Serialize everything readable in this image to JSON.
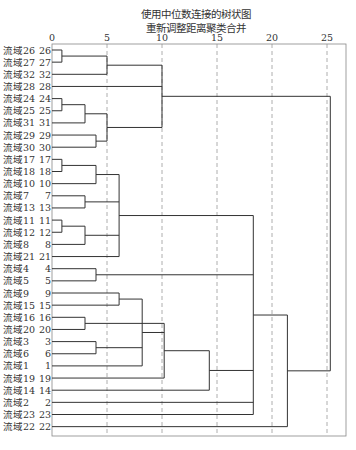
{
  "chart_data": {
    "type": "dendrogram",
    "title": "使用中位数连接的树状图",
    "subtitle": "重新调整距离聚类合并",
    "xlabel": "",
    "ylabel": "",
    "xlim": [
      0,
      25
    ],
    "x_ticks": [
      0,
      5,
      10,
      15,
      20,
      25
    ],
    "grid": "dashed vertical at ticks",
    "leaves": [
      {
        "label": "流域26",
        "id": "26"
      },
      {
        "label": "流域27",
        "id": "27"
      },
      {
        "label": "流域32",
        "id": "32"
      },
      {
        "label": "流域28",
        "id": "28"
      },
      {
        "label": "流域24",
        "id": "24"
      },
      {
        "label": "流域25",
        "id": "25"
      },
      {
        "label": "流域31",
        "id": "31"
      },
      {
        "label": "流域29",
        "id": "29"
      },
      {
        "label": "流域30",
        "id": "30"
      },
      {
        "label": "流域17",
        "id": "17"
      },
      {
        "label": "流域18",
        "id": "18"
      },
      {
        "label": "流域10",
        "id": "10"
      },
      {
        "label": "流域7",
        "id": "7"
      },
      {
        "label": "流域13",
        "id": "13"
      },
      {
        "label": "流域11",
        "id": "11"
      },
      {
        "label": "流域12",
        "id": "12"
      },
      {
        "label": "流域8",
        "id": "8"
      },
      {
        "label": "流域21",
        "id": "21"
      },
      {
        "label": "流域4",
        "id": "4"
      },
      {
        "label": "流域5",
        "id": "5"
      },
      {
        "label": "流域9",
        "id": "9"
      },
      {
        "label": "流域15",
        "id": "15"
      },
      {
        "label": "流域16",
        "id": "16"
      },
      {
        "label": "流域20",
        "id": "20"
      },
      {
        "label": "流域3",
        "id": "3"
      },
      {
        "label": "流域6",
        "id": "6"
      },
      {
        "label": "流域1",
        "id": "1"
      },
      {
        "label": "流域19",
        "id": "19"
      },
      {
        "label": "流域14",
        "id": "14"
      },
      {
        "label": "流域2",
        "id": "2"
      },
      {
        "label": "流域23",
        "id": "23"
      },
      {
        "label": "流域22",
        "id": "22"
      }
    ],
    "merges": [
      {
        "id": "m1",
        "children": [
          0,
          1
        ],
        "height": 0.9
      },
      {
        "id": "m2",
        "children": [
          "m1",
          2
        ],
        "height": 5.0
      },
      {
        "id": "m3",
        "children": [
          4,
          5
        ],
        "height": 0.9
      },
      {
        "id": "m4",
        "children": [
          "m3",
          6
        ],
        "height": 3.0
      },
      {
        "id": "m5",
        "children": [
          7,
          8
        ],
        "height": 4.0
      },
      {
        "id": "m6",
        "children": [
          "m4",
          "m5"
        ],
        "height": 5.0
      },
      {
        "id": "m7",
        "children": [
          "m2",
          3,
          "m6"
        ],
        "height": 10.0
      },
      {
        "id": "m8",
        "children": [
          9,
          10
        ],
        "height": 0.9
      },
      {
        "id": "m9",
        "children": [
          "m8",
          11
        ],
        "height": 4.0
      },
      {
        "id": "m10",
        "children": [
          12,
          13
        ],
        "height": 3.0
      },
      {
        "id": "m11",
        "children": [
          14,
          15
        ],
        "height": 0.9
      },
      {
        "id": "m12",
        "children": [
          "m11",
          16
        ],
        "height": 3.0
      },
      {
        "id": "m13",
        "children": [
          "m9",
          "m10",
          "m12",
          17
        ],
        "height": 6.1
      },
      {
        "id": "m14",
        "children": [
          18,
          19
        ],
        "height": 4.0
      },
      {
        "id": "m15",
        "children": [
          20,
          21
        ],
        "height": 6.1
      },
      {
        "id": "m16",
        "children": [
          22,
          23
        ],
        "height": 3.0
      },
      {
        "id": "m17",
        "children": [
          24,
          25
        ],
        "height": 4.0
      },
      {
        "id": "m18",
        "children": [
          "m15",
          "m17",
          26
        ],
        "height": 8.2
      },
      {
        "id": "m19",
        "children": [
          "m16",
          "m18",
          27
        ],
        "height": 10.2
      },
      {
        "id": "m20",
        "children": [
          "m19",
          28
        ],
        "height": 14.3
      },
      {
        "id": "m21",
        "children": [
          "m13",
          "m14",
          "m20",
          29,
          30
        ],
        "height": 18.3
      },
      {
        "id": "m22",
        "children": [
          "m21",
          31
        ],
        "height": 21.4
      },
      {
        "id": "m23",
        "children": [
          "m7",
          "m22"
        ],
        "height": 25.3
      }
    ]
  }
}
